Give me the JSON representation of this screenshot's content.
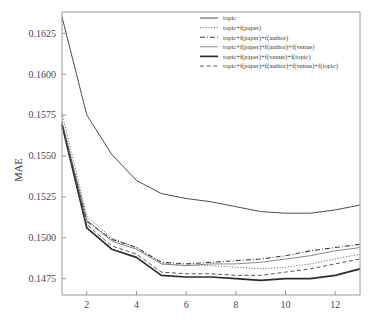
{
  "chart_data": {
    "type": "line",
    "title": "",
    "xlabel": "",
    "ylabel": "MAE",
    "xlim": [
      1,
      13
    ],
    "ylim": [
      0.1465,
      0.1638
    ],
    "grid": false,
    "legend_position": "upper-right",
    "xticks": [
      2,
      4,
      6,
      8,
      10,
      12
    ],
    "xtick_labels": [
      "2",
      "4",
      "6",
      "8",
      "10",
      "12"
    ],
    "yticks": [
      0.1475,
      0.15,
      0.1525,
      0.155,
      0.1575,
      0.16,
      0.1625
    ],
    "ytick_labels": [
      "0.1475",
      "0.1500",
      "0.1525",
      "0.1550",
      "0.1575",
      "0.1600",
      "0.1625"
    ],
    "x": [
      1,
      2,
      3,
      4,
      5,
      6,
      7,
      8,
      9,
      10,
      11,
      12,
      13
    ],
    "series": [
      {
        "name": "topic",
        "style": "solid-thin",
        "color": "#3a3a3a",
        "values": [
          0.1635,
          0.1575,
          0.1551,
          0.1535,
          0.1527,
          0.1524,
          0.1522,
          0.1519,
          0.1516,
          0.1515,
          0.1515,
          0.1517,
          0.152
        ]
      },
      {
        "name": "topic+f(paper)",
        "style": "dotted",
        "color": "#4a4a4a",
        "values": [
          0.1576,
          0.1513,
          0.15,
          0.1494,
          0.1484,
          0.1483,
          0.1483,
          0.1482,
          0.1481,
          0.1482,
          0.1484,
          0.1487,
          0.149
        ]
      },
      {
        "name": "topic+f(paper)+f(author)",
        "style": "dash-dot",
        "color": "#3f3f3f",
        "values": [
          0.1569,
          0.151,
          0.1499,
          0.1494,
          0.1485,
          0.1484,
          0.1485,
          0.1486,
          0.1487,
          0.1489,
          0.1492,
          0.1494,
          0.1496
        ]
      },
      {
        "name": "topic+f(paper)+f(author)+f(venue)",
        "style": "solid-faint",
        "color": "#7d7d7d",
        "values": [
          0.1571,
          0.1511,
          0.1498,
          0.1493,
          0.1484,
          0.1483,
          0.1484,
          0.1484,
          0.1485,
          0.1487,
          0.1489,
          0.1492,
          0.1494
        ]
      },
      {
        "name": "topic+f(paper)+f(venue)+f(topic)",
        "style": "solid-thick",
        "color": "#2b2b2b",
        "values": [
          0.1569,
          0.1506,
          0.1493,
          0.1488,
          0.1477,
          0.1476,
          0.1476,
          0.1475,
          0.1474,
          0.1475,
          0.1475,
          0.1477,
          0.1481
        ]
      },
      {
        "name": "topic+f(paper)+f(author)+f(venue)+f(topic)",
        "style": "dashed",
        "color": "#565656",
        "values": [
          0.157,
          0.1508,
          0.1495,
          0.149,
          0.1479,
          0.1478,
          0.1478,
          0.1477,
          0.1477,
          0.1479,
          0.1481,
          0.1484,
          0.1487
        ]
      }
    ]
  },
  "legend": {
    "entries": [
      "topic",
      "topic+f(paper)",
      "topic+f(paper)+f(author)",
      "topic+f(paper)+f(author)+f(venue)",
      "topic+f(paper)+f(venue)+f(topic)",
      "topic+f(paper)+f(author)+f(venue)+f(topic)"
    ]
  },
  "footer": {
    "clipped_text": ""
  }
}
